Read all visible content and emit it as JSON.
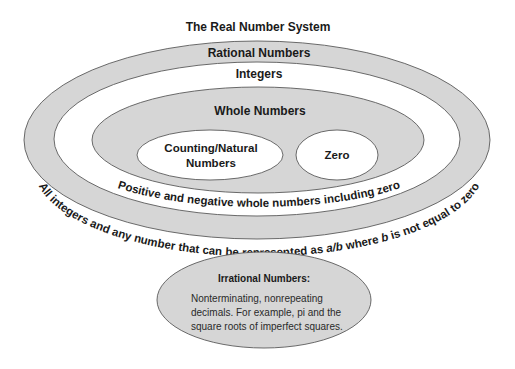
{
  "diagram": {
    "title": "The Real Number System",
    "rational": {
      "label": "Rational Numbers",
      "description": "All integers and any number that can be represented as a/b where b is not equal to zero",
      "description_parts": [
        "All integers and any number that can be represented as ",
        "a/b",
        " where ",
        "b",
        " is not equal to zero"
      ]
    },
    "integers": {
      "label": "Integers",
      "description": "Positive and negative whole numbers including zero"
    },
    "whole": {
      "label": "Whole Numbers"
    },
    "counting": {
      "label_line1": "Counting/Natural",
      "label_line2": "Numbers"
    },
    "zero": {
      "label": "Zero"
    },
    "irrational": {
      "label": "Irrational Numbers:",
      "desc_line1": "Nonterminating, nonrepeating",
      "desc_line2": "decimals. For example, pi and the",
      "desc_line3": "square roots of imperfect squares."
    },
    "colors": {
      "gray_fill": "#d6d6d6",
      "white_fill": "#ffffff",
      "outline": "#5a5a5a",
      "text": "#1a1a1a"
    }
  }
}
